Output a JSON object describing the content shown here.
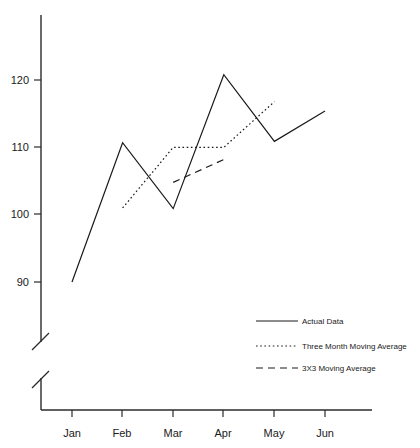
{
  "chart_data": {
    "type": "line",
    "title": "",
    "subtitle": "",
    "xlabel": "",
    "ylabel": "",
    "categories": [
      "Jan",
      "Feb",
      "Mar",
      "Apr",
      "May",
      "Jun"
    ],
    "x_tick_labels": [
      "Jan",
      "Feb",
      "Mar",
      "Apr",
      "May",
      "Jun"
    ],
    "y_tick_labels": [
      "90",
      "100",
      "110",
      "120"
    ],
    "y_tick_values": [
      90,
      100,
      110,
      120
    ],
    "ylim": [
      90,
      128
    ],
    "xlim": [
      "Jan",
      "Jun"
    ],
    "grid": false,
    "axis_break": true,
    "legend_position": "inside-bottom-right",
    "series": [
      {
        "name": "Actual Data",
        "style": "solid",
        "x": [
          "Jan",
          "Feb",
          "Mar",
          "Apr",
          "May",
          "Jun"
        ],
        "values": [
          90.0,
          110.7,
          100.9,
          120.8,
          110.9,
          115.4
        ]
      },
      {
        "name": "Three Month Moving Average",
        "style": "dotted",
        "x": [
          "Feb",
          "Mar",
          "Apr",
          "May"
        ],
        "values": [
          101.0,
          110.0,
          110.0,
          116.8
        ]
      },
      {
        "name": "3X3 Moving Average",
        "style": "dashed",
        "x": [
          "Mar",
          "Apr"
        ],
        "values": [
          104.8,
          108.2
        ]
      }
    ]
  },
  "legend": {
    "entries": [
      {
        "label": "Actual Data",
        "style": "solid"
      },
      {
        "label": "Three Month Moving Average",
        "style": "dotted"
      },
      {
        "label": "3X3 Moving Average",
        "style": "dashed"
      }
    ]
  },
  "axis": {
    "y_labels": [
      "120",
      "110",
      "100",
      "90"
    ],
    "x_labels": [
      "Jan",
      "Feb",
      "Mar",
      "Apr",
      "May",
      "Jun"
    ]
  },
  "colors": {
    "background": "#ffffff",
    "axis": "#2b2b2b",
    "series": "#1a1a1a",
    "text": "#1a1a1a"
  }
}
